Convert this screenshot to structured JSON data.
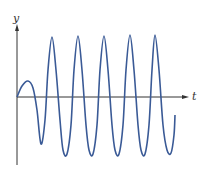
{
  "figure": {
    "y_axis_label": "y",
    "t_axis_label": "t",
    "curve_color": "#3a5a96",
    "axis_color": "#333333"
  },
  "chart_data": {
    "type": "line",
    "title": "",
    "xlabel": "t",
    "ylabel": "y",
    "grid": false,
    "legend": "none",
    "series": [
      {
        "name": "y(t)",
        "points_px": [
          [
            17,
            97
          ],
          [
            22,
            86
          ],
          [
            28,
            81
          ],
          [
            33,
            88
          ],
          [
            37,
            110
          ],
          [
            41,
            144
          ],
          [
            45,
            120
          ],
          [
            48,
            70
          ],
          [
            52,
            37
          ],
          [
            56,
            70
          ],
          [
            60,
            120
          ],
          [
            63,
            150
          ],
          [
            67,
            154
          ],
          [
            71,
            125
          ],
          [
            74,
            70
          ],
          [
            78,
            36
          ],
          [
            82,
            70
          ],
          [
            86,
            125
          ],
          [
            89,
            150
          ],
          [
            93,
            154
          ],
          [
            97,
            125
          ],
          [
            100,
            70
          ],
          [
            104,
            36
          ],
          [
            108,
            70
          ],
          [
            112,
            125
          ],
          [
            115,
            150
          ],
          [
            119,
            154
          ],
          [
            123,
            125
          ],
          [
            126,
            70
          ],
          [
            130,
            35
          ],
          [
            134,
            70
          ],
          [
            138,
            125
          ],
          [
            141,
            150
          ],
          [
            145,
            154
          ],
          [
            149,
            125
          ],
          [
            152,
            70
          ],
          [
            155,
            35
          ],
          [
            159,
            70
          ],
          [
            163,
            125
          ],
          [
            167,
            150
          ],
          [
            171,
            153
          ],
          [
            174,
            135
          ],
          [
            175,
            115
          ]
        ]
      }
    ],
    "annotations": [
      "y",
      "t"
    ]
  }
}
